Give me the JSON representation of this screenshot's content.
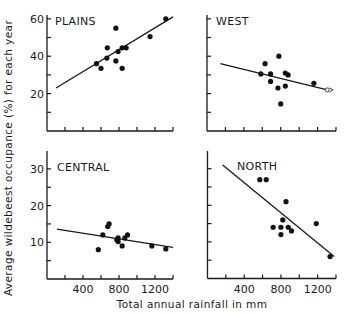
{
  "figure": {
    "y_axis_label": "Average wildebeest occupance (%) for each year",
    "x_axis_label": "Total annual rainfall in mm",
    "colors": {
      "ink": "#1a1a1a",
      "background": "#ffffff"
    }
  },
  "chart_data": [
    {
      "type": "scatter",
      "title": "PLAINS",
      "xlabel": "Total annual rainfall in mm",
      "ylabel": "Average wildebeest occupance (%) for each year",
      "xlim": [
        0,
        1400
      ],
      "ylim": [
        0,
        65
      ],
      "x_ticks": [
        0,
        200,
        400,
        600,
        800,
        1000,
        1200,
        1400
      ],
      "x_tick_labels": [],
      "y_ticks": [
        10,
        20,
        30,
        40,
        50,
        60
      ],
      "y_tick_labels": [
        "20",
        "40",
        "60"
      ],
      "y_tick_label_values": [
        20,
        40,
        60
      ],
      "points": [
        {
          "x": 550,
          "y": 36
        },
        {
          "x": 600,
          "y": 33.5
        },
        {
          "x": 665,
          "y": 39
        },
        {
          "x": 670,
          "y": 44.5
        },
        {
          "x": 765,
          "y": 55
        },
        {
          "x": 765,
          "y": 37.5
        },
        {
          "x": 790,
          "y": 42.5
        },
        {
          "x": 835,
          "y": 33.5
        },
        {
          "x": 835,
          "y": 44.5
        },
        {
          "x": 880,
          "y": 44.5
        },
        {
          "x": 1145,
          "y": 50.5
        },
        {
          "x": 1320,
          "y": 60
        }
      ],
      "fit_line": {
        "x1": 100,
        "y1": 23,
        "x2": 1400,
        "y2": 61
      },
      "grid": false
    },
    {
      "type": "scatter",
      "title": "WEST",
      "xlabel": "Total annual rainfall in mm",
      "ylabel": "Average wildebeest occupance (%) for each year",
      "xlim": [
        0,
        1400
      ],
      "ylim": [
        0,
        65
      ],
      "x_ticks": [
        0,
        200,
        400,
        600,
        800,
        1000,
        1200,
        1400
      ],
      "x_tick_labels": [],
      "y_ticks": [
        10,
        20,
        30,
        40,
        50,
        60
      ],
      "y_tick_labels": [],
      "points": [
        {
          "x": 585,
          "y": 30.5
        },
        {
          "x": 630,
          "y": 36
        },
        {
          "x": 690,
          "y": 30.5
        },
        {
          "x": 690,
          "y": 26.5
        },
        {
          "x": 770,
          "y": 23
        },
        {
          "x": 780,
          "y": 40
        },
        {
          "x": 800,
          "y": 14.5
        },
        {
          "x": 850,
          "y": 31
        },
        {
          "x": 850,
          "y": 24
        },
        {
          "x": 880,
          "y": 30
        },
        {
          "x": 1160,
          "y": 25.5
        }
      ],
      "open_points": [
        {
          "x": 1305,
          "y": 22
        }
      ],
      "fit_line": {
        "x1": 145,
        "y1": 36,
        "x2": 1305,
        "y2": 22
      },
      "grid": false
    },
    {
      "type": "scatter",
      "title": "CENTRAL",
      "xlabel": "Total annual rainfall in mm",
      "ylabel": "Average wildebeest occupance (%) for each year",
      "xlim": [
        0,
        1400
      ],
      "ylim": [
        0,
        35
      ],
      "x_ticks": [
        0,
        200,
        400,
        600,
        800,
        1000,
        1200,
        1400
      ],
      "x_tick_labels": [
        "400",
        "800",
        "1200"
      ],
      "x_tick_label_values": [
        400,
        800,
        1200
      ],
      "y_ticks": [
        5,
        10,
        15,
        20,
        25,
        30
      ],
      "y_tick_labels": [
        "10",
        "20",
        "30"
      ],
      "y_tick_label_values": [
        10,
        20,
        30
      ],
      "points": [
        {
          "x": 570,
          "y": 8
        },
        {
          "x": 620,
          "y": 12
        },
        {
          "x": 675,
          "y": 14.3
        },
        {
          "x": 690,
          "y": 15
        },
        {
          "x": 775,
          "y": 10.7
        },
        {
          "x": 790,
          "y": 11.2
        },
        {
          "x": 790,
          "y": 10.2
        },
        {
          "x": 835,
          "y": 9
        },
        {
          "x": 865,
          "y": 11.2
        },
        {
          "x": 895,
          "y": 12
        },
        {
          "x": 1165,
          "y": 9
        },
        {
          "x": 1320,
          "y": 8.2
        }
      ],
      "fit_line": {
        "x1": 110,
        "y1": 13.6,
        "x2": 1400,
        "y2": 8.6
      },
      "grid": false
    },
    {
      "type": "scatter",
      "title": "NORTH",
      "xlabel": "Total annual rainfall in mm",
      "ylabel": "Average wildebeest occupance (%) for each year",
      "xlim": [
        0,
        1400
      ],
      "ylim": [
        0,
        35
      ],
      "x_ticks": [
        0,
        200,
        400,
        600,
        800,
        1000,
        1200,
        1400
      ],
      "x_tick_labels": [
        "400",
        "800",
        "1200"
      ],
      "x_tick_label_values": [
        400,
        800,
        1200
      ],
      "y_ticks": [
        5,
        10,
        15,
        20,
        25,
        30
      ],
      "y_tick_labels": [],
      "points": [
        {
          "x": 570,
          "y": 27
        },
        {
          "x": 640,
          "y": 27
        },
        {
          "x": 715,
          "y": 14
        },
        {
          "x": 800,
          "y": 14
        },
        {
          "x": 800,
          "y": 12
        },
        {
          "x": 820,
          "y": 16
        },
        {
          "x": 855,
          "y": 21
        },
        {
          "x": 880,
          "y": 14
        },
        {
          "x": 915,
          "y": 13
        },
        {
          "x": 1185,
          "y": 15
        },
        {
          "x": 1335,
          "y": 6
        }
      ],
      "fit_line": {
        "x1": 165,
        "y1": 31,
        "x2": 1380,
        "y2": 6
      },
      "grid": false
    }
  ],
  "panels_layout": [
    {
      "title_index": 0,
      "x0": 47,
      "x1": 173,
      "y0": 131,
      "yTop": 15,
      "ymax_px_per_unit": 1.87
    },
    {
      "title_index": 1,
      "x0": 207,
      "x1": 336,
      "y0": 131,
      "yTop": 15,
      "ymax_px_per_unit": 1.87
    },
    {
      "title_index": 2,
      "x0": 47,
      "x1": 173,
      "y0": 279,
      "yTop": 151,
      "ymax_px_per_unit": 3.67
    },
    {
      "title_index": 3,
      "x0": 207.5,
      "x1": 336,
      "y0": 278.5,
      "yTop": 151,
      "ymax_px_per_unit": 3.66
    }
  ]
}
